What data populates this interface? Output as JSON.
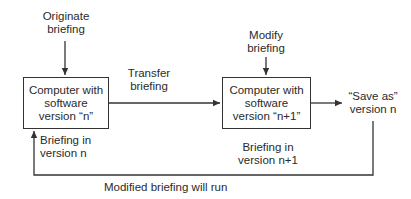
{
  "diagram": {
    "type": "flowchart",
    "nodes": {
      "originate": {
        "lines": [
          "Originate",
          "briefing"
        ]
      },
      "box_n": {
        "lines": [
          "Computer with",
          "software",
          "version “n”"
        ]
      },
      "transfer": {
        "lines": [
          "Transfer",
          "briefing"
        ]
      },
      "modify": {
        "lines": [
          "Modify",
          "briefing"
        ]
      },
      "box_n1": {
        "lines": [
          "Computer with",
          "software",
          "version “n+1”"
        ]
      },
      "save_as": {
        "lines": [
          "“Save as”",
          "version n"
        ]
      },
      "briefing_n": {
        "lines": [
          "Briefing in",
          "version n"
        ]
      },
      "briefing_n1": {
        "lines": [
          "Briefing in",
          "version n+1"
        ]
      },
      "feedback": {
        "lines": [
          "Modified briefing will run"
        ]
      }
    },
    "edges": [
      {
        "from": "originate",
        "to": "box_n"
      },
      {
        "from": "box_n",
        "to": "box_n1",
        "label": "transfer"
      },
      {
        "from": "modify",
        "to": "box_n1"
      },
      {
        "from": "box_n1",
        "to": "save_as"
      },
      {
        "from": "save_as",
        "to": "box_n",
        "label": "feedback"
      }
    ],
    "colors": {
      "line": "#333333",
      "text": "#2a2a2a",
      "background": "#ffffff"
    }
  }
}
